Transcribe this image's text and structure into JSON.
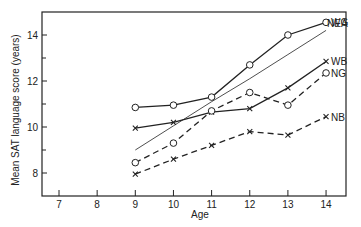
{
  "chart_data": {
    "type": "line",
    "title": "",
    "xlabel": "Age",
    "ylabel": "Mean SAT language score (years)",
    "xlim": [
      6.5,
      14.75
    ],
    "ylim": [
      7,
      15
    ],
    "x_ticks": [
      7,
      8,
      9,
      10,
      11,
      12,
      13,
      14
    ],
    "y_ticks": [
      8,
      10,
      12,
      14
    ],
    "grid": false,
    "legend_position": "inline-right",
    "x": [
      9,
      10,
      11,
      12,
      13,
      14
    ],
    "series": [
      {
        "name": "WG",
        "marker": "circle",
        "style": "solid",
        "values": [
          10.85,
          10.95,
          11.3,
          12.7,
          14.0,
          14.55
        ]
      },
      {
        "name": "NEA",
        "marker": "none",
        "style": "thin-solid",
        "values": [
          9.0,
          10.05,
          11.1,
          12.1,
          13.15,
          14.2
        ]
      },
      {
        "name": "WB",
        "marker": "x",
        "style": "solid",
        "values": [
          9.95,
          10.2,
          10.65,
          10.8,
          11.7,
          12.85
        ]
      },
      {
        "name": "NG",
        "marker": "circle",
        "style": "dashed",
        "values": [
          8.45,
          9.3,
          10.7,
          11.5,
          10.95,
          12.35
        ]
      },
      {
        "name": "NB",
        "marker": "x",
        "style": "dashed",
        "values": [
          7.95,
          8.6,
          9.2,
          9.8,
          9.65,
          10.45
        ]
      }
    ]
  }
}
